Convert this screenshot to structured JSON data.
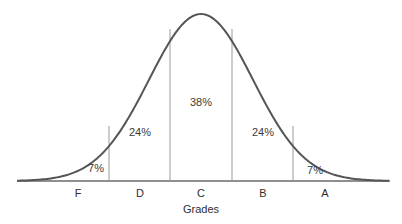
{
  "chart_data": {
    "type": "area",
    "title": "",
    "xlabel": "Grades",
    "ylabel": "",
    "grid": false,
    "legend": null,
    "categories": [
      "F",
      "D",
      "C",
      "B",
      "A"
    ],
    "values": [
      7,
      24,
      38,
      24,
      7
    ],
    "value_labels": [
      "7%",
      "24%",
      "38%",
      "24%",
      "7%"
    ],
    "value_unit": "%"
  },
  "colors": {
    "curve": "#555555",
    "dividers": "#9a9a9a",
    "baseline": "#666666",
    "text": "#333333"
  }
}
